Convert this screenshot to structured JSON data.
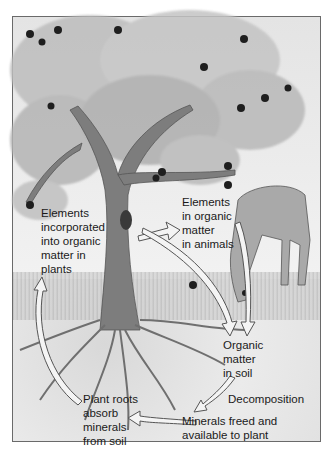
{
  "diagram": {
    "labels": {
      "plants": "Elements\nincorporated\ninto organic\nmatter in\nplants",
      "animals": "Elements\nin organic\nmatter\nin animals",
      "soil_organic": "Organic\nmatter\nin soil",
      "decomposition": "Decomposition",
      "minerals": "Minerals freed and\navailable to plant",
      "roots": "Plant roots\nabsorb\nminerals\nfrom soil"
    },
    "flow": [
      {
        "from": "plants",
        "to": "animals"
      },
      {
        "from": "plants",
        "to": "soil_organic"
      },
      {
        "from": "animals",
        "to": "soil_organic"
      },
      {
        "from": "soil_organic",
        "to": "minerals",
        "via": "decomposition"
      },
      {
        "from": "minerals",
        "to": "roots"
      },
      {
        "from": "roots",
        "to": "plants"
      }
    ],
    "illustration": [
      "fruit-tree",
      "horse",
      "roots",
      "soil",
      "grass"
    ]
  }
}
